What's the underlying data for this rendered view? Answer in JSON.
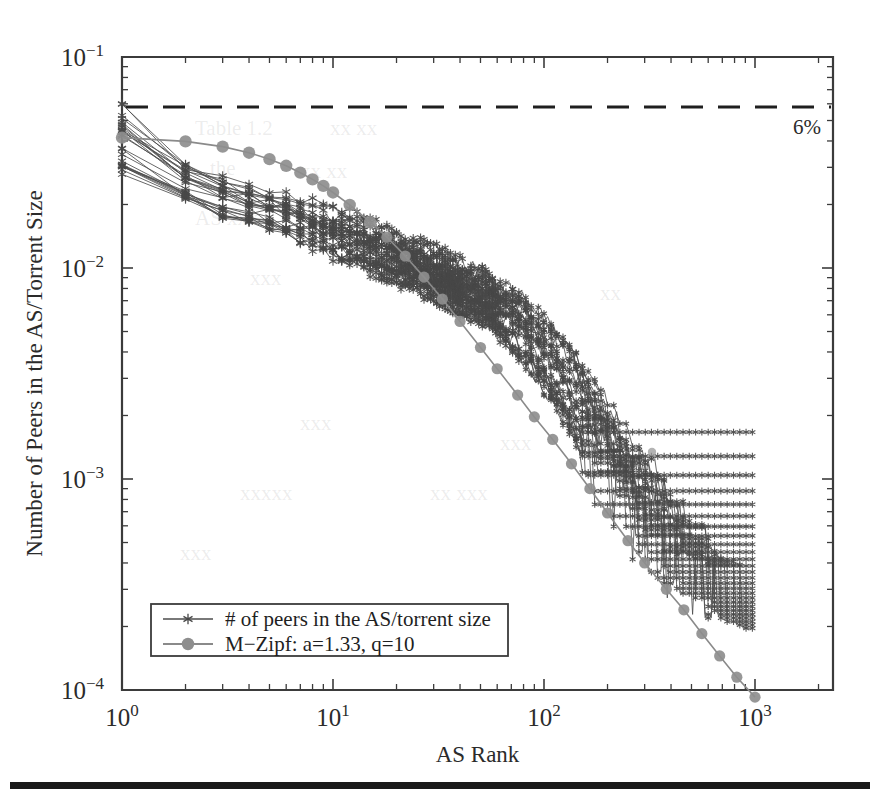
{
  "figure": {
    "background_color": "#ffffff",
    "data_color": "#4d4d4d",
    "model_color": "#8e8e8e",
    "axis_color": "#3b3b3b"
  },
  "annotations": {
    "threshold_label": "6%"
  },
  "axis_labels": {
    "y_title": "Number of Peers in the AS/Torrent Size",
    "x_title": "AS Rank",
    "y_ticks": [
      "10-1",
      "10-2",
      "10-3",
      "10-4"
    ],
    "x_ticks": [
      "100",
      "101",
      "102",
      "103"
    ]
  },
  "legend": {
    "items": [
      {
        "label": "# of peers in the AS/torrent size",
        "marker": "star",
        "color": "#4d4d4d"
      },
      {
        "label": "M−Zipf: a=1.33, q=10",
        "marker": "circle",
        "color": "#8e8e8e"
      }
    ]
  },
  "chart_data": {
    "type": "line",
    "title": "",
    "xlabel": "AS Rank",
    "ylabel": "Number of Peers in the AS/Torrent Size",
    "xscale": "log",
    "yscale": "log",
    "xlim": [
      1,
      2000
    ],
    "ylim": [
      0.0001,
      0.1
    ],
    "grid": false,
    "legend_position": "lower-left",
    "annotations": [
      {
        "type": "hline",
        "y": 0.058,
        "label": "6%",
        "style": "dashed",
        "label_position": "right"
      }
    ],
    "series": [
      {
        "name": "# of peers in the AS/torrent size",
        "marker": "star",
        "color": "#4d4d4d",
        "note": "Ensemble of ~25 per-torrent curves forming a dense band; spread is widest at rank 1 and narrows with rank; discrete plateaus appear in the tail from integer peer counts.",
        "x": [
          1,
          2,
          3,
          4,
          5,
          6,
          7,
          8,
          9,
          10,
          15,
          20,
          30,
          40,
          50,
          60,
          70,
          80,
          100,
          125,
          150,
          200,
          250,
          300,
          400,
          500,
          650,
          800,
          1000
        ],
        "band_low": [
          0.028,
          0.0205,
          0.0178,
          0.0163,
          0.0152,
          0.0143,
          0.0135,
          0.0128,
          0.0122,
          0.0117,
          0.0099,
          0.0088,
          0.0073,
          0.0064,
          0.0057,
          0.005,
          0.0044,
          0.0038,
          0.00275,
          0.00195,
          0.00145,
          0.00092,
          0.00063,
          0.00046,
          0.00029,
          0.00021,
          0.000155,
          0.000125,
          0.0001
        ],
        "band_high": [
          0.058,
          0.0318,
          0.0272,
          0.0248,
          0.0232,
          0.022,
          0.021,
          0.0202,
          0.0195,
          0.0189,
          0.016,
          0.0142,
          0.012,
          0.0105,
          0.0094,
          0.0085,
          0.0077,
          0.007,
          0.0056,
          0.0042,
          0.0033,
          0.0022,
          0.00155,
          0.00118,
          0.00078,
          0.00056,
          0.0004,
          0.0003,
          0.00022
        ],
        "band_center": [
          0.04,
          0.0255,
          0.0222,
          0.0202,
          0.0189,
          0.0178,
          0.017,
          0.0163,
          0.0157,
          0.0152,
          0.0128,
          0.0113,
          0.0094,
          0.0082,
          0.0073,
          0.0065,
          0.0058,
          0.0052,
          0.0039,
          0.0029,
          0.0022,
          0.00142,
          0.00099,
          0.00074,
          0.00048,
          0.00034,
          0.00025,
          0.00019,
          0.00014
        ]
      },
      {
        "name": "M-Zipf: a=1.33, q=10",
        "marker": "circle",
        "color": "#8e8e8e",
        "a": 1.33,
        "q": 10,
        "x": [
          1,
          2,
          3,
          4,
          5,
          6,
          7,
          8,
          9,
          10,
          12,
          15,
          18,
          22,
          27,
          33,
          40,
          50,
          60,
          75,
          90,
          110,
          135,
          165,
          200,
          250,
          300,
          380,
          460,
          560,
          680,
          820,
          1000
        ],
        "y": [
          0.0415,
          0.0398,
          0.0376,
          0.0352,
          0.0328,
          0.0305,
          0.0283,
          0.0263,
          0.0245,
          0.0228,
          0.0199,
          0.0165,
          0.014,
          0.0114,
          0.00905,
          0.00712,
          0.00558,
          0.0042,
          0.00333,
          0.0025,
          0.00197,
          0.00154,
          0.00118,
          0.0009,
          0.00069,
          0.00051,
          0.0004,
          0.0003,
          0.00024,
          0.000185,
          0.000145,
          0.000115,
          9.25e-05
        ]
      }
    ]
  }
}
